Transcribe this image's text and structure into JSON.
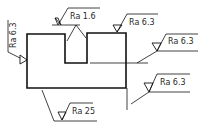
{
  "drawing": {
    "type": "surface roughness annotation",
    "stroke_color": "#111111",
    "labels": {
      "left_face": "Ra 6.3",
      "notch": "Ra 1.6",
      "top_right": "Ra 6.3",
      "notch_floor_extension": "Ra 6.3",
      "right_face": "Ra 6.3",
      "bottom": "Ra 25"
    }
  }
}
